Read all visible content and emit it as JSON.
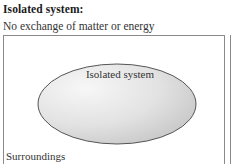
{
  "diagram": {
    "title": "Isolated system:",
    "subtitle": "No exchange of matter or energy",
    "system_label": "Isolated system",
    "surroundings_label": "Surroundings",
    "colors": {
      "border": "#8a8a8a",
      "ellipse_stroke": "#555555",
      "ellipse_fill_light": "#f4f4f4",
      "ellipse_fill_dark": "#c9c9c9"
    }
  }
}
